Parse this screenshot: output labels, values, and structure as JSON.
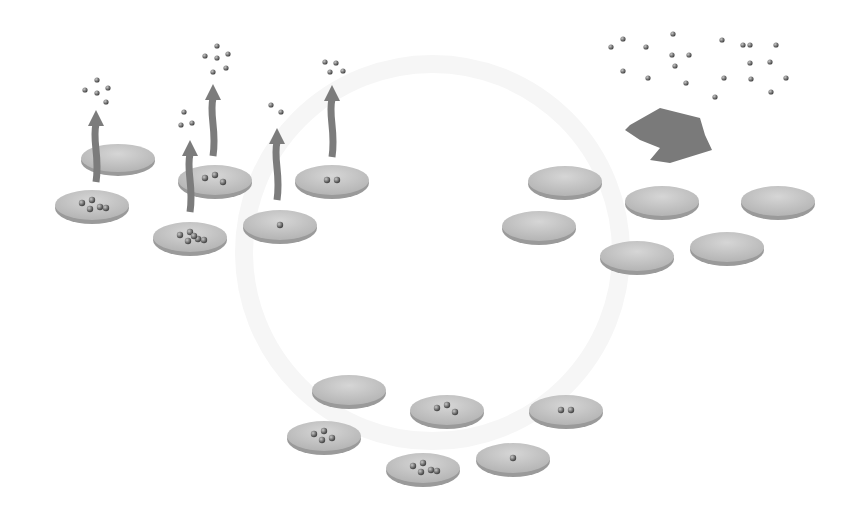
{
  "diagram": {
    "type": "evaporation-condensation-cycle",
    "colors": {
      "dish": "#c4c4c4",
      "dish_rim": "#9a9a9a",
      "particle": "#6a6a6a",
      "arrow": "#7c7c7c",
      "ghost": "#f3f3f3"
    },
    "clusters": [
      {
        "name": "evaporating-dishes",
        "dishes": [
          {
            "cx": 118,
            "cy": 158,
            "rx": 37,
            "ry": 15,
            "particles": 0
          },
          {
            "cx": 92,
            "cy": 205,
            "rx": 37,
            "ry": 16,
            "particles": 5
          },
          {
            "cx": 215,
            "cy": 180,
            "rx": 37,
            "ry": 16,
            "particles": 3
          },
          {
            "cx": 190,
            "cy": 237,
            "rx": 37,
            "ry": 16,
            "particles": 6
          },
          {
            "cx": 280,
            "cy": 225,
            "rx": 37,
            "ry": 16,
            "particles": 1
          },
          {
            "cx": 332,
            "cy": 180,
            "rx": 37,
            "ry": 16,
            "particles": 2
          }
        ],
        "arrows": [
          {
            "x": 96,
            "y_bottom": 182,
            "y_top": 110
          },
          {
            "x": 190,
            "y_bottom": 212,
            "y_top": 140
          },
          {
            "x": 213,
            "y_bottom": 156,
            "y_top": 84
          },
          {
            "x": 277,
            "y_bottom": 200,
            "y_top": 128
          },
          {
            "x": 332,
            "y_bottom": 157,
            "y_top": 85
          }
        ],
        "vapor_groups": [
          {
            "points": [
              [
                97,
                80
              ],
              [
                85,
                90
              ],
              [
                97,
                93
              ],
              [
                108,
                88
              ],
              [
                106,
                102
              ]
            ]
          },
          {
            "points": [
              [
                184,
                112
              ],
              [
                181,
                125
              ],
              [
                192,
                123
              ]
            ]
          },
          {
            "points": [
              [
                217,
                46
              ],
              [
                205,
                56
              ],
              [
                217,
                58
              ],
              [
                228,
                54
              ],
              [
                213,
                72
              ],
              [
                226,
                68
              ]
            ]
          },
          {
            "points": [
              [
                271,
                105
              ],
              [
                281,
                112
              ]
            ]
          },
          {
            "points": [
              [
                325,
                62
              ],
              [
                336,
                63
              ],
              [
                330,
                72
              ],
              [
                343,
                71
              ]
            ]
          }
        ]
      },
      {
        "name": "empty-dishes",
        "dishes": [
          {
            "cx": 565,
            "cy": 181,
            "rx": 37,
            "ry": 16
          },
          {
            "cx": 539,
            "cy": 226,
            "rx": 37,
            "ry": 16
          },
          {
            "cx": 662,
            "cy": 201,
            "rx": 37,
            "ry": 16
          },
          {
            "cx": 778,
            "cy": 201,
            "rx": 37,
            "ry": 16
          },
          {
            "cx": 637,
            "cy": 256,
            "rx": 37,
            "ry": 16
          },
          {
            "cx": 727,
            "cy": 247,
            "rx": 37,
            "ry": 16
          }
        ],
        "heat_shape": {
          "points": "630,125 660,108 700,118 705,135 712,150 670,163 650,160 660,148 640,140 625,130"
        },
        "vapor_points": [
          [
            611,
            47
          ],
          [
            623,
            39
          ],
          [
            646,
            47
          ],
          [
            673,
            34
          ],
          [
            672,
            55
          ],
          [
            689,
            55
          ],
          [
            675,
            66
          ],
          [
            623,
            71
          ],
          [
            648,
            78
          ],
          [
            686,
            83
          ],
          [
            722,
            40
          ],
          [
            724,
            78
          ],
          [
            743,
            45
          ],
          [
            750,
            63
          ],
          [
            751,
            79
          ],
          [
            750,
            45
          ],
          [
            770,
            62
          ],
          [
            776,
            45
          ],
          [
            786,
            78
          ],
          [
            771,
            92
          ],
          [
            715,
            97
          ]
        ]
      },
      {
        "name": "condensing-dishes",
        "dishes": [
          {
            "cx": 349,
            "cy": 390,
            "rx": 37,
            "ry": 16,
            "particles": 0
          },
          {
            "cx": 324,
            "cy": 436,
            "rx": 37,
            "ry": 16,
            "particles": 4
          },
          {
            "cx": 447,
            "cy": 410,
            "rx": 37,
            "ry": 16,
            "particles": 3
          },
          {
            "cx": 566,
            "cy": 410,
            "rx": 37,
            "ry": 16,
            "particles": 2
          },
          {
            "cx": 423,
            "cy": 468,
            "rx": 37,
            "ry": 16,
            "particles": 5
          },
          {
            "cx": 513,
            "cy": 458,
            "rx": 37,
            "ry": 16,
            "particles": 1
          }
        ]
      }
    ]
  }
}
